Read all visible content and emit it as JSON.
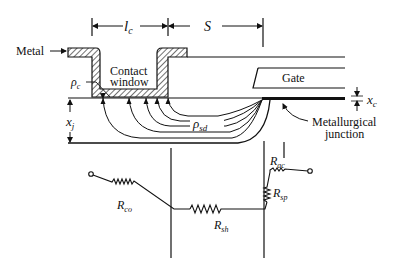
{
  "figure": {
    "type": "semiconductor-contact-cross-section",
    "labels": {
      "metal": "Metal",
      "contact_window_line1": "Contact",
      "contact_window_line2": "window",
      "gate": "Gate",
      "metallurgical_line1": "Metallurgical",
      "metallurgical_line2": "junction"
    },
    "dimensions": {
      "contact_length": {
        "symbol": "l",
        "sub": "c"
      },
      "spacing": {
        "symbol": "S",
        "sub": ""
      },
      "junction_depth": {
        "symbol": "x",
        "sub": "j"
      },
      "oxide_thickness": {
        "symbol": "x",
        "sub": "c"
      }
    },
    "resistivities": {
      "contact": {
        "symbol": "ρ",
        "sub": "c"
      },
      "source_drain": {
        "symbol": "ρ",
        "sub": "sd"
      }
    },
    "resistors": [
      {
        "id": "co",
        "symbol": "R",
        "sub": "co"
      },
      {
        "id": "sh",
        "symbol": "R",
        "sub": "sh"
      },
      {
        "id": "sp",
        "symbol": "R",
        "sub": "sp"
      },
      {
        "id": "ac",
        "symbol": "R",
        "sub": "ac"
      }
    ],
    "colors": {
      "ink": "#111111",
      "background": "#ffffff"
    }
  }
}
